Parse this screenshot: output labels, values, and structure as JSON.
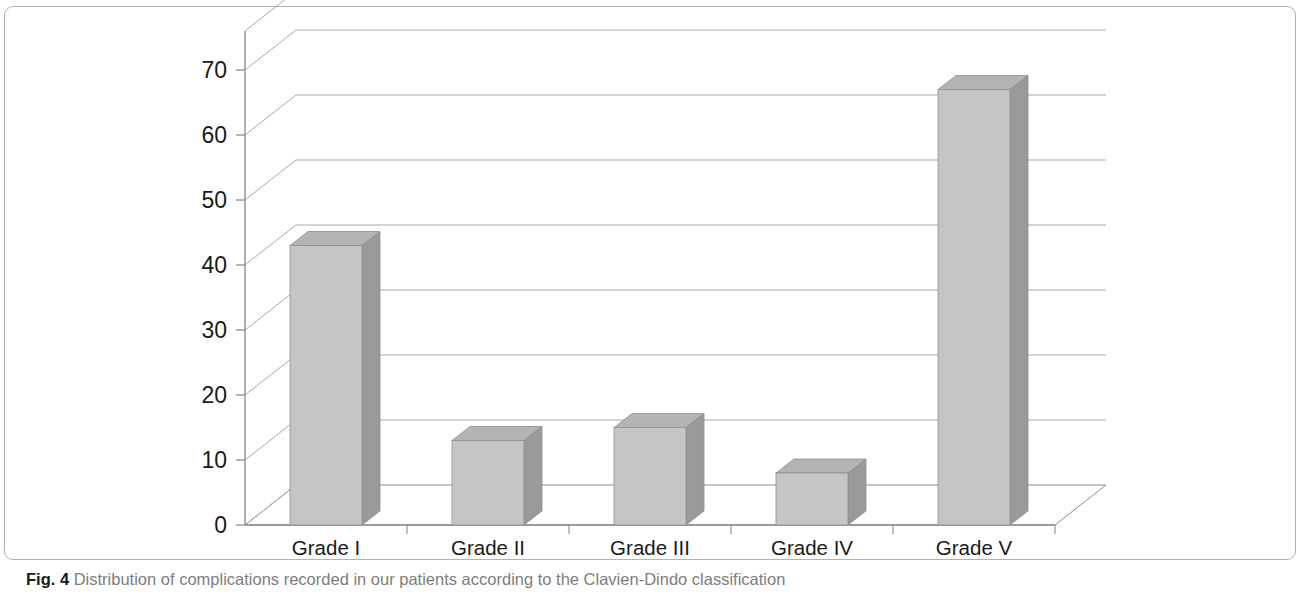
{
  "figure": {
    "caption_number": "Fig. 4",
    "caption_text": " Distribution of complications recorded in our patients according to the Clavien-Dindo classification"
  },
  "chart_data": {
    "type": "bar",
    "title": "",
    "subtitle": "",
    "xlabel": "",
    "ylabel": "",
    "categories": [
      "Grade I",
      "Grade II",
      "Grade III",
      "Grade IV",
      "Grade V"
    ],
    "values": [
      43,
      13,
      15,
      8,
      67
    ],
    "series": [
      {
        "name": "Number of complications",
        "values": [
          43,
          13,
          15,
          8,
          67
        ]
      }
    ],
    "ylim": [
      0,
      76
    ],
    "yticks": [
      0,
      10,
      20,
      30,
      40,
      50,
      60,
      70
    ],
    "ytick_labels": [
      "0",
      "10",
      "20",
      "30",
      "40",
      "50",
      "60",
      "70"
    ],
    "grid": true,
    "grid_axis": "y",
    "legend": false,
    "legend_position": "none",
    "three_d": true,
    "annotations": [],
    "colors": {
      "bar_front": "#c5c5c5",
      "bar_side": "#9a9a9a",
      "bar_top": "#b4b4b4",
      "bar_edge": "#8f8f8f",
      "gridline": "#a8a8a8",
      "axis": "#8c8c8c",
      "text": "#1a1a1a",
      "caption_text": "#7d7d7d",
      "frame_border": "#b3b3b3",
      "background": "#ffffff"
    }
  }
}
